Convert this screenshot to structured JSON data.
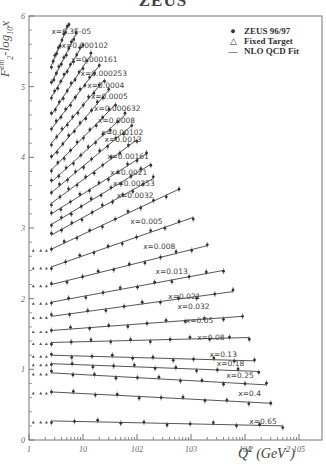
{
  "title": "ZEUS",
  "chart_data": {
    "type": "scatter",
    "title": "ZEUS",
    "xlabel": "Q^2 (GeV^2)",
    "ylabel": "F_2^em - log_10 x",
    "xscale": "log",
    "xlim": [
      1,
      200000
    ],
    "ylim": [
      0,
      6
    ],
    "x_ticks": [
      "1",
      "10",
      "10^2",
      "10^3",
      "10^4",
      "10^5"
    ],
    "y_ticks": [
      "0",
      "1",
      "2",
      "3",
      "4",
      "5",
      "6"
    ],
    "grid": false,
    "legend_position": "upper right",
    "legend": [
      {
        "symbol": "filled-circle",
        "label": "ZEUS 96/97"
      },
      {
        "symbol": "open-triangle",
        "label": "Fixed Target"
      },
      {
        "symbol": "line",
        "label": "NLO QCD Fit"
      }
    ],
    "series": [
      {
        "name": "x=6.3E-05",
        "label_pos": [
          2.6,
          5.75
        ],
        "fit": [
          [
            2.6,
            5.3
          ],
          [
            5.5,
            5.9
          ]
        ]
      },
      {
        "name": "x=0.000102",
        "label_pos": [
          4.0,
          5.55
        ],
        "fit": [
          [
            2.6,
            5.05
          ],
          [
            7.5,
            5.75
          ]
        ]
      },
      {
        "name": "x=0.000161",
        "label_pos": [
          6.0,
          5.35
        ],
        "fit": [
          [
            2.6,
            4.85
          ],
          [
            10,
            5.6
          ]
        ]
      },
      {
        "name": "x=0.000253",
        "label_pos": [
          9.0,
          5.15
        ],
        "fit": [
          [
            2.6,
            4.6
          ],
          [
            14,
            5.45
          ]
        ]
      },
      {
        "name": "x=0.0004",
        "label_pos": [
          12.0,
          4.98
        ],
        "fit": [
          [
            2.6,
            4.4
          ],
          [
            20,
            5.3
          ]
        ]
      },
      {
        "name": "x=0.0005",
        "label_pos": [
          14.0,
          4.82
        ],
        "fit": [
          [
            2.6,
            4.2
          ],
          [
            25,
            5.1
          ]
        ]
      },
      {
        "name": "x=0.000632",
        "label_pos": [
          16.0,
          4.65
        ],
        "fit": [
          [
            2.6,
            4.0
          ],
          [
            30,
            4.95
          ]
        ]
      },
      {
        "name": "x=0.0008",
        "label_pos": [
          19.0,
          4.48
        ],
        "fit": [
          [
            2.6,
            3.82
          ],
          [
            40,
            4.75
          ]
        ]
      },
      {
        "name": "x=0.00102",
        "label_pos": [
          22.0,
          4.31
        ],
        "fit": [
          [
            2.6,
            3.65
          ],
          [
            60,
            4.6
          ]
        ]
      },
      {
        "name": "x=0.0013",
        "label_pos": [
          25.0,
          4.22
        ],
        "fit": [
          [
            2.6,
            3.5
          ],
          [
            80,
            4.45
          ]
        ]
      },
      {
        "name": "x=0.00161",
        "label_pos": [
          28.0,
          3.98
        ],
        "fit": [
          [
            2.6,
            3.35
          ],
          [
            100,
            4.25
          ]
        ]
      },
      {
        "name": "x=0.0021",
        "label_pos": [
          32.0,
          3.75
        ],
        "fit": [
          [
            2.6,
            3.2
          ],
          [
            150,
            4.05
          ]
        ]
      },
      {
        "name": "x=0.00253",
        "label_pos": [
          36.0,
          3.6
        ],
        "fit": [
          [
            2.6,
            3.05
          ],
          [
            180,
            3.9
          ]
        ]
      },
      {
        "name": "x=0.0032",
        "label_pos": [
          42.0,
          3.42
        ],
        "fit": [
          [
            2.6,
            2.9
          ],
          [
            200,
            3.7
          ]
        ]
      },
      {
        "name": "x=0.005",
        "label_pos": [
          75.0,
          3.05
        ],
        "fit": [
          [
            2.6,
            2.7
          ],
          [
            600,
            3.55
          ]
        ]
      },
      {
        "name": "x=0.008",
        "label_pos": [
          130.0,
          2.7
        ],
        "fit": [
          [
            2.6,
            2.45
          ],
          [
            1100,
            3.15
          ]
        ]
      },
      {
        "name": "x=0.013",
        "label_pos": [
          220.0,
          2.35
        ],
        "fit": [
          [
            2.6,
            2.2
          ],
          [
            2000,
            2.75
          ]
        ]
      },
      {
        "name": "x=0.021",
        "label_pos": [
          380.0,
          2.0
        ],
        "fit": [
          [
            2.6,
            1.95
          ],
          [
            4000,
            2.4
          ]
        ]
      },
      {
        "name": "x=0.032",
        "label_pos": [
          560.0,
          1.85
        ],
        "fit": [
          [
            2.6,
            1.75
          ],
          [
            6000,
            2.1
          ]
        ]
      },
      {
        "name": "x=0.05",
        "label_pos": [
          800.0,
          1.65
        ],
        "fit": [
          [
            2.6,
            1.55
          ],
          [
            9000,
            1.75
          ]
        ]
      },
      {
        "name": "x=0.08",
        "label_pos": [
          1300.0,
          1.42
        ],
        "fit": [
          [
            2.6,
            1.38
          ],
          [
            12000,
            1.45
          ]
        ]
      },
      {
        "name": "x=0.13",
        "label_pos": [
          2200.0,
          1.18
        ],
        "fit": [
          [
            2.6,
            1.2
          ],
          [
            15000,
            1.12
          ]
        ]
      },
      {
        "name": "x=0.18",
        "label_pos": [
          3000.0,
          1.05
        ],
        "fit": [
          [
            2.6,
            1.08
          ],
          [
            18000,
            0.97
          ]
        ]
      },
      {
        "name": "x=0.25",
        "label_pos": [
          4500.0,
          0.88
        ],
        "fit": [
          [
            2.6,
            0.95
          ],
          [
            25000,
            0.78
          ]
        ]
      },
      {
        "name": "x=0.4",
        "label_pos": [
          7500.0,
          0.62
        ],
        "fit": [
          [
            2.6,
            0.68
          ],
          [
            30000,
            0.52
          ]
        ]
      },
      {
        "name": "x=0.65",
        "label_pos": [
          12000.0,
          0.22
        ],
        "fit": [
          [
            2.6,
            0.27
          ],
          [
            50000,
            0.2
          ]
        ]
      }
    ]
  }
}
